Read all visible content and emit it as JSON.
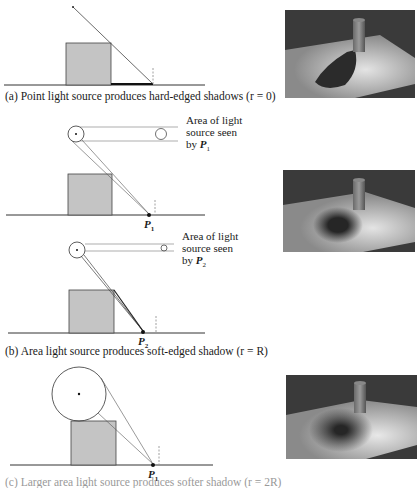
{
  "figure": {
    "panel_a": {
      "caption": "(a) Point light source produces hard-edged shadows (r = 0)"
    },
    "panel_b": {
      "top": {
        "label_lines": [
          "Area of light",
          "source seen",
          "by "
        ],
        "point": "P",
        "sub": "1"
      },
      "bottom": {
        "label_lines": [
          "Area of light",
          "source seen",
          "by "
        ],
        "point": "P",
        "sub": "2"
      },
      "caption": "(b) Area light source produces soft-edged shadow (r = R)"
    },
    "panel_c": {
      "point": "P",
      "sub": "1",
      "caption_partial": "(c) Larger area light source produces softer shadow (r = 2R)"
    },
    "colors": {
      "box_fill": "#c4c4c4",
      "line": "#333333",
      "render_dark": "#3a3a3a",
      "render_light": "#d8d8d8"
    }
  }
}
